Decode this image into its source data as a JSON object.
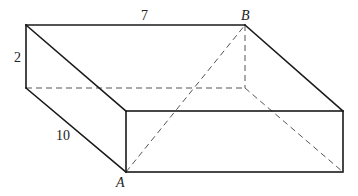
{
  "figure": {
    "type": "rectangular-prism",
    "vertices": {
      "A": {
        "label": "A",
        "note": "front bottom-left corner"
      },
      "B": {
        "label": "B",
        "note": "back top-right corner"
      }
    },
    "dimensions": {
      "length": {
        "label": "7",
        "value": 7,
        "edge": "top back edge"
      },
      "height": {
        "label": "2",
        "value": 2,
        "edge": "left back vertical edge"
      },
      "depth": {
        "label": "10",
        "value": 10,
        "edge": "left bottom depth edge"
      }
    },
    "labels": {
      "length": "7",
      "height": "2",
      "depth": "10",
      "point_a": "A",
      "point_b": "B"
    },
    "colors": {
      "solid_edge": "#1a1a1a",
      "hidden_edge": "#555555",
      "background": "#ffffff"
    }
  }
}
